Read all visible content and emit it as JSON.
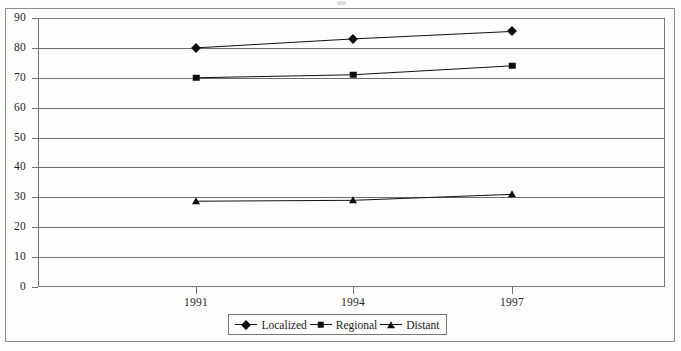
{
  "chart_data": {
    "type": "line",
    "title": "",
    "subtitle": "",
    "xlabel": "",
    "ylabel": "",
    "categories": [
      "1991",
      "1994",
      "1997"
    ],
    "x": [
      1991,
      1994,
      1997
    ],
    "series": [
      {
        "name": "Localized",
        "marker": "diamond",
        "values": [
          80,
          83,
          85.5
        ]
      },
      {
        "name": "Regional",
        "marker": "square",
        "values": [
          70,
          71,
          74
        ]
      },
      {
        "name": "Distant",
        "marker": "triangle",
        "values": [
          28.7,
          29,
          31
        ]
      }
    ],
    "ylim": [
      0,
      90
    ],
    "yticks": [
      0,
      10,
      20,
      30,
      40,
      50,
      60,
      70,
      80,
      90
    ],
    "ytick_labels": [
      "0",
      "10",
      "20",
      "30",
      "40",
      "50",
      "60",
      "70",
      "80",
      "90"
    ],
    "grid": "horizontal",
    "legend_position": "bottom-center",
    "line_color": "#111111",
    "marker_color": "#0c0c0c",
    "grid_color": "#6d6d6d",
    "axis_color": "#6f6f6f",
    "background_color": "#fdfdfc"
  },
  "legend": {
    "items": [
      {
        "label": "Localized",
        "marker": "diamond-marker"
      },
      {
        "label": "Regional",
        "marker": "square-marker"
      },
      {
        "label": "Distant",
        "marker": "triangle-marker"
      }
    ]
  }
}
